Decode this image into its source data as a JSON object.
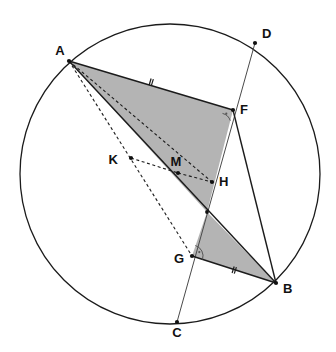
{
  "figure": {
    "background_color": "#ffffff",
    "stroke_color": "#1b1b1b",
    "shade_color": "#b4b4b4",
    "width": 336,
    "height": 352
  },
  "circle": {
    "name": "main-circle",
    "center_x": 170,
    "center_y": 174,
    "radius": 150,
    "stroke": "#1b1b1b"
  },
  "points": [
    {
      "id": "A",
      "label": "A",
      "x": 69,
      "y": 61,
      "label_x": 60,
      "label_y": 52,
      "on_circle": true,
      "has_dot": true
    },
    {
      "id": "D",
      "label": "D",
      "x": 255,
      "y": 43,
      "label_x": 262,
      "label_y": 35,
      "on_circle": true,
      "has_dot": true
    },
    {
      "id": "F",
      "label": "F",
      "x": 233,
      "y": 110,
      "label_x": 240,
      "label_y": 111,
      "on_circle": false,
      "has_dot": true
    },
    {
      "id": "K",
      "label": "K",
      "x": 131,
      "y": 158,
      "label_x": 118,
      "label_y": 161,
      "on_circle": false,
      "has_dot": true
    },
    {
      "id": "M",
      "label": "M",
      "x": 178,
      "y": 173,
      "label_x": 174,
      "label_y": 163,
      "on_circle": false,
      "has_dot": true
    },
    {
      "id": "H",
      "label": "H",
      "x": 212,
      "y": 182,
      "label_x": 219,
      "label_y": 183,
      "on_circle": false,
      "has_dot": true
    },
    {
      "id": "G",
      "label": "G",
      "x": 192,
      "y": 256,
      "label_x": 181,
      "label_y": 260,
      "on_circle": false,
      "has_dot": true
    },
    {
      "id": "B",
      "label": "B",
      "x": 276,
      "y": 283,
      "label_x": 283,
      "label_y": 290,
      "on_circle": true,
      "has_dot": true
    },
    {
      "id": "C",
      "label": "C",
      "x": 177,
      "y": 322,
      "label_x": 177,
      "label_y": 334,
      "on_circle": true,
      "has_dot": true
    }
  ],
  "shaded_regions": [
    {
      "name": "upper-shaded-triangle",
      "vertices": "69,61 233,110 207,212",
      "fill": "#b4b4b4"
    },
    {
      "name": "lower-shaded-triangle",
      "vertices": "207,212 276,283 192,256",
      "fill": "#b4b4b4"
    }
  ],
  "segments": [
    {
      "name": "segment-AF",
      "style": "solid",
      "x1": 69,
      "y1": 61,
      "x2": 233,
      "y2": 110
    },
    {
      "name": "segment-AB",
      "style": "solid",
      "x1": 69,
      "y1": 61,
      "x2": 276,
      "y2": 283
    },
    {
      "name": "segment-FB",
      "style": "solid",
      "x1": 233,
      "y1": 110,
      "x2": 276,
      "y2": 283
    },
    {
      "name": "segment-GB",
      "style": "solid",
      "x1": 192,
      "y1": 256,
      "x2": 276,
      "y2": 283
    },
    {
      "name": "segment-DC",
      "style": "thin",
      "x1": 255,
      "y1": 43,
      "x2": 177,
      "y2": 322
    },
    {
      "name": "segment-AM-dashed",
      "style": "dashed",
      "x1": 69,
      "y1": 61,
      "x2": 212,
      "y2": 182
    },
    {
      "name": "segment-AG-dashed",
      "style": "dashed",
      "x1": 69,
      "y1": 61,
      "x2": 192,
      "y2": 256
    },
    {
      "name": "segment-KM-dashed",
      "style": "dashed",
      "x1": 131,
      "y1": 158,
      "x2": 178,
      "y2": 173
    },
    {
      "name": "segment-MH-dashed",
      "style": "dashed",
      "x1": 178,
      "y1": 173,
      "x2": 212,
      "y2": 182
    }
  ],
  "tick_marks": [
    {
      "name": "tick-on-AF",
      "x": 151,
      "y": 82,
      "angle": 16.6
    },
    {
      "name": "tick-on-GB",
      "x": 234,
      "y": 270,
      "angle": 17.8
    }
  ],
  "angle_markers": [
    {
      "name": "right-angle-marker-F",
      "x": 233,
      "y": 110,
      "start_deg": 162,
      "end_deg": 256,
      "radius": 11
    },
    {
      "name": "right-angle-marker-G",
      "x": 192,
      "y": 256,
      "start_deg": -72,
      "end_deg": 18,
      "radius": 11
    }
  ]
}
